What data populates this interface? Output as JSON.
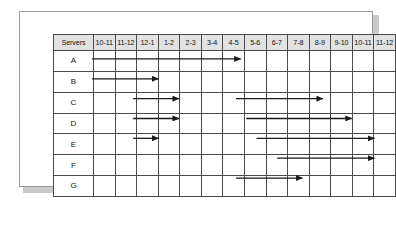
{
  "chart_data": {
    "type": "table",
    "header": {
      "row_label_header": "Servers",
      "time_slots": [
        "10-11",
        "11-12",
        "12-1",
        "1-2",
        "2-3",
        "3-4",
        "4-5",
        "5-6",
        "6-7",
        "7-8",
        "8-9",
        "9-10",
        "10-11",
        "11-12"
      ]
    },
    "rows": [
      {
        "label": "A",
        "bars": [
          {
            "start": 0,
            "end": 7.5,
            "start_slot": "10-11",
            "end_slot": "5-6"
          }
        ]
      },
      {
        "label": "B",
        "bars": [
          {
            "start": 0,
            "end": 3.5,
            "start_slot": "10-11",
            "end_slot": "1-2"
          }
        ]
      },
      {
        "label": "C",
        "bars": [
          {
            "start": 2,
            "end": 4.5,
            "start_slot": "12-1",
            "end_slot": "2-3"
          },
          {
            "start": 7,
            "end": 11.5,
            "start_slot": "5-6",
            "end_slot": "9-10"
          }
        ]
      },
      {
        "label": "D",
        "bars": [
          {
            "start": 2,
            "end": 4.5,
            "start_slot": "12-1",
            "end_slot": "2-3"
          },
          {
            "start": 7.5,
            "end": 12.9,
            "start_slot": "5-6",
            "end_slot": "10-11"
          }
        ]
      },
      {
        "label": "E",
        "bars": [
          {
            "start": 2,
            "end": 3.5,
            "start_slot": "12-1",
            "end_slot": "1-2"
          },
          {
            "start": 8,
            "end": 14,
            "start_slot": "6-7",
            "end_slot": "11-12"
          }
        ]
      },
      {
        "label": "F",
        "bars": [
          {
            "start": 9,
            "end": 14,
            "start_slot": "7-8",
            "end_slot": "11-12"
          }
        ]
      },
      {
        "label": "G",
        "bars": [
          {
            "start": 7,
            "end": 10.5,
            "start_slot": "5-6",
            "end_slot": "8-9"
          }
        ]
      }
    ],
    "colors": {
      "arrow": "#1a1a1a",
      "grid_line": "#4a4a4a",
      "header_fill": "#e2e2e2",
      "panel_border": "#9a9a9a",
      "panel_shadow": "#c9c9c9",
      "background": "#ffffff"
    },
    "layout": {
      "label_column_width": 39,
      "slot_column_width": 20.57,
      "header_height": 15,
      "row_height": 19.85,
      "grid": true
    }
  }
}
